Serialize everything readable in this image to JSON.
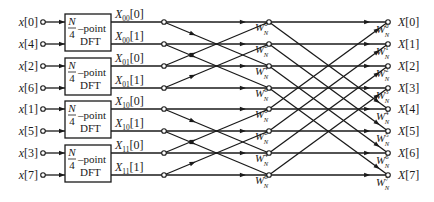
{
  "diagram": {
    "inputs": [
      "x[0]",
      "x[4]",
      "x[2]",
      "x[6]",
      "x[1]",
      "x[5]",
      "x[3]",
      "x[7]"
    ],
    "dft_blocks": [
      {
        "numerator": "N",
        "denominator": "4",
        "suffix": "–point",
        "label": "DFT"
      },
      {
        "numerator": "N",
        "denominator": "4",
        "suffix": "–point",
        "label": "DFT"
      },
      {
        "numerator": "N",
        "denominator": "4",
        "suffix": "–point",
        "label": "DFT"
      },
      {
        "numerator": "N",
        "denominator": "4",
        "suffix": "–point",
        "label": "DFT"
      }
    ],
    "dft_outputs": [
      {
        "base": "X",
        "sub": "00",
        "idx": "[0]"
      },
      {
        "base": "X",
        "sub": "00",
        "idx": "[1]"
      },
      {
        "base": "X",
        "sub": "01",
        "idx": "[0]"
      },
      {
        "base": "X",
        "sub": "01",
        "idx": "[1]"
      },
      {
        "base": "X",
        "sub": "10",
        "idx": "[0]"
      },
      {
        "base": "X",
        "sub": "10",
        "idx": "[1]"
      },
      {
        "base": "X",
        "sub": "11",
        "idx": "[0]"
      },
      {
        "base": "X",
        "sub": "11",
        "idx": "[1]"
      }
    ],
    "stage1_twiddles": [
      {
        "base": "W",
        "sub": "N",
        "sup": "0"
      },
      {
        "base": "W",
        "sub": "N",
        "sup": "2"
      },
      {
        "base": "W",
        "sub": "N",
        "sup": "4"
      },
      {
        "base": "W",
        "sub": "N",
        "sup": "6"
      },
      {
        "base": "W",
        "sub": "N",
        "sup": "0"
      },
      {
        "base": "W",
        "sub": "N",
        "sup": "2"
      },
      {
        "base": "W",
        "sub": "N",
        "sup": "4"
      },
      {
        "base": "W",
        "sub": "N",
        "sup": "6"
      }
    ],
    "stage2_twiddles": [
      {
        "base": "W",
        "sub": "N",
        "sup": "0"
      },
      {
        "base": "W",
        "sub": "N",
        "sup": "1"
      },
      {
        "base": "W",
        "sub": "N",
        "sup": "2"
      },
      {
        "base": "W",
        "sub": "N",
        "sup": "3"
      },
      {
        "base": "W",
        "sub": "N",
        "sup": "4"
      },
      {
        "base": "W",
        "sub": "N",
        "sup": "5"
      },
      {
        "base": "W",
        "sub": "N",
        "sup": "6"
      },
      {
        "base": "W",
        "sub": "N",
        "sup": "7"
      }
    ],
    "outputs": [
      "X[0]",
      "X[1]",
      "X[2]",
      "X[3]",
      "X[4]",
      "X[5]",
      "X[6]",
      "X[7]"
    ],
    "colors": {
      "line": "#1a1a1a",
      "background": "#ffffff"
    }
  }
}
